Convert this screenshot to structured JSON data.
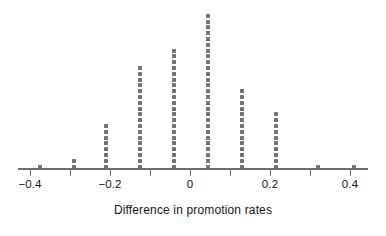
{
  "chart_data": {
    "type": "scatter",
    "plot_style": "dot-plot-stacked",
    "title": "",
    "subtitle": "",
    "xlabel": "Difference in promotion rates",
    "ylabel": "",
    "xlim": [
      -0.44,
      0.44
    ],
    "x_ticks": [
      -0.4,
      -0.2,
      0,
      0.2,
      0.4
    ],
    "x_tick_labels": [
      "−0.4",
      "−0.2",
      "0",
      "0.2",
      "0.4"
    ],
    "minor_tick_positions": [
      -0.4,
      -0.3,
      -0.2,
      -0.1,
      0,
      0.1,
      0.2,
      0.3,
      0.4
    ],
    "grid": false,
    "legend": false,
    "legend_position": "none",
    "dot_color": "#737373",
    "axis_color": "#6e6e6e",
    "text_color": "#141414",
    "background": "#ffffff",
    "categories": [
      -0.375,
      -0.29,
      -0.21,
      -0.125,
      -0.04,
      0.045,
      0.13,
      0.215,
      0.32,
      0.41
    ],
    "values": [
      1,
      2,
      8,
      18,
      21,
      27,
      14,
      10,
      1,
      1
    ],
    "stacks": [
      {
        "x": -0.375,
        "count": 1
      },
      {
        "x": -0.29,
        "count": 2
      },
      {
        "x": -0.21,
        "count": 8
      },
      {
        "x": -0.125,
        "count": 18
      },
      {
        "x": -0.04,
        "count": 21
      },
      {
        "x": 0.045,
        "count": 27
      },
      {
        "x": 0.13,
        "count": 14
      },
      {
        "x": 0.215,
        "count": 10
      },
      {
        "x": 0.32,
        "count": 1
      },
      {
        "x": 0.41,
        "count": 1
      }
    ],
    "total_points": 103,
    "annotations": []
  },
  "axis": {
    "title": "Difference in promotion rates",
    "tick_labels": [
      "−0.4",
      "−0.2",
      "0",
      "0.2",
      "0.4"
    ]
  }
}
